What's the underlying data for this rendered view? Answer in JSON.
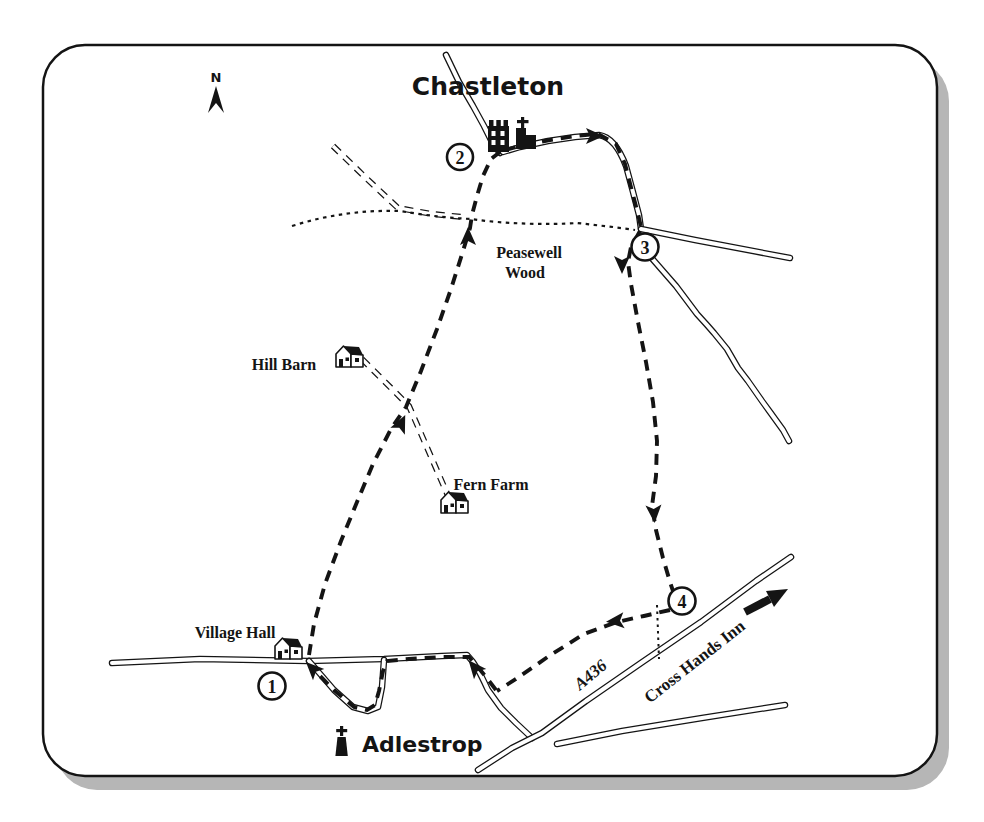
{
  "map": {
    "north_label": "N",
    "settlements": {
      "chastleton": "Chastleton",
      "adlestrop": "Adlestrop"
    },
    "places": {
      "peasewell_wood": [
        "Peasewell",
        "Wood"
      ],
      "hill_barn": "Hill Barn",
      "fern_farm": "Fern Farm",
      "village_hall": "Village Hall",
      "cross_hands_inn": "Cross Hands Inn"
    },
    "roads": {
      "a436": "A436"
    },
    "waypoints": [
      "1",
      "2",
      "3",
      "4"
    ],
    "colors": {
      "ink": "#141414",
      "paper": "#ffffff",
      "shadow": "#b6b6b6"
    }
  }
}
